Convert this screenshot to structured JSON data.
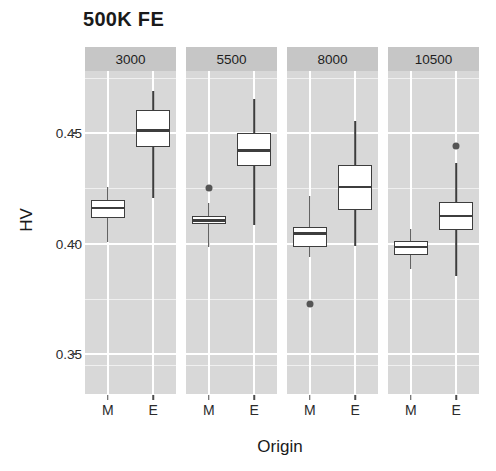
{
  "chart_data": {
    "type": "box",
    "title": "500K FE",
    "xlabel": "Origin",
    "ylabel": "HV",
    "ylim": [
      0.332,
      0.478
    ],
    "yticks": [
      0.45,
      0.4,
      0.35
    ],
    "ytick_labels": [
      "0.45",
      "0.40",
      "0.35"
    ],
    "yminor": [
      0.475,
      0.425,
      0.375,
      0.345
    ],
    "grid": true,
    "legend": "none",
    "facet_variable": "budget",
    "facets": [
      {
        "label": "3000",
        "categories": [
          "M",
          "E"
        ],
        "boxes": [
          {
            "category": "M",
            "whisker_low": 0.4005,
            "q1": 0.4115,
            "median": 0.416,
            "q3": 0.4195,
            "whisker_high": 0.4255,
            "outliers": []
          },
          {
            "category": "E",
            "whisker_low": 0.4205,
            "q1": 0.4435,
            "median": 0.451,
            "q3": 0.4605,
            "whisker_high": 0.469,
            "outliers": []
          }
        ]
      },
      {
        "label": "5500",
        "categories": [
          "M",
          "E"
        ],
        "boxes": [
          {
            "category": "M",
            "whisker_low": 0.3985,
            "q1": 0.409,
            "median": 0.4105,
            "q3": 0.4125,
            "whisker_high": 0.4185,
            "outliers": [
              0.425
            ]
          },
          {
            "category": "E",
            "whisker_low": 0.4085,
            "q1": 0.435,
            "median": 0.442,
            "q3": 0.45,
            "whisker_high": 0.4655,
            "outliers": []
          }
        ]
      },
      {
        "label": "8000",
        "categories": [
          "M",
          "E"
        ],
        "boxes": [
          {
            "category": "M",
            "whisker_low": 0.394,
            "q1": 0.3985,
            "median": 0.4045,
            "q3": 0.4075,
            "whisker_high": 0.4215,
            "outliers": [
              0.3725
            ]
          },
          {
            "category": "E",
            "whisker_low": 0.399,
            "q1": 0.415,
            "median": 0.4255,
            "q3": 0.4355,
            "whisker_high": 0.4555,
            "outliers": []
          }
        ]
      },
      {
        "label": "10500",
        "categories": [
          "M",
          "E"
        ],
        "boxes": [
          {
            "category": "M",
            "whisker_low": 0.3885,
            "q1": 0.395,
            "median": 0.3985,
            "q3": 0.401,
            "whisker_high": 0.4065,
            "outliers": []
          },
          {
            "category": "E",
            "whisker_low": 0.3855,
            "q1": 0.406,
            "median": 0.4125,
            "q3": 0.419,
            "whisker_high": 0.4365,
            "outliers": [
              0.444
            ]
          }
        ]
      }
    ]
  },
  "style": {
    "panel_background": "#d8d8d8",
    "strip_background": "#c6c6c6",
    "gridline_color": "#ffffff",
    "box_stroke": "#3d3d3d",
    "box_fill": "#ffffff",
    "outlier_color": "#555555",
    "text_color": "#1a1a1a"
  }
}
